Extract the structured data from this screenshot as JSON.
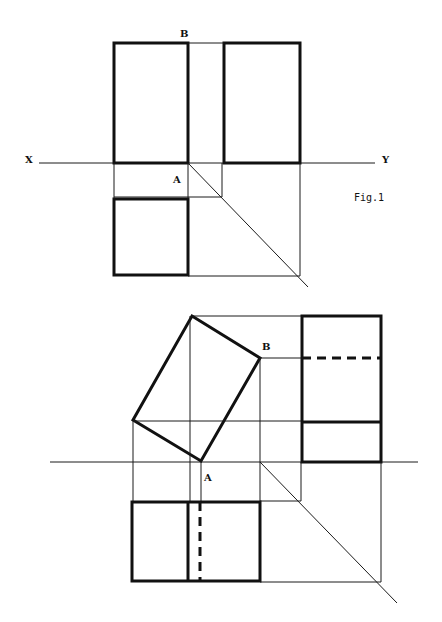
{
  "figure1": {
    "labels": {
      "x": "X",
      "y": "Y",
      "a": "A",
      "b": "B",
      "caption": "Fig.1"
    }
  },
  "figure2": {
    "labels": {
      "a": "A",
      "b": "B"
    }
  },
  "colors": {
    "line": "#111111",
    "background": "#ffffff"
  }
}
